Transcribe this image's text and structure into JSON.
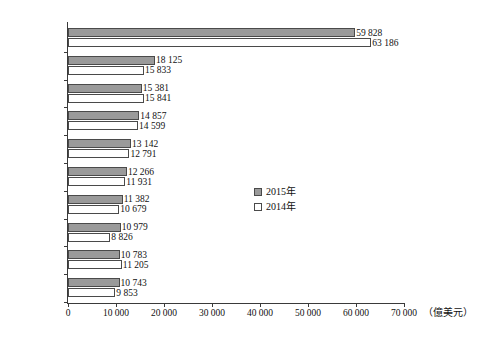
{
  "chart_data": {
    "type": "bar",
    "orientation": "horizontal",
    "title": "",
    "xlabel": "（億美元）",
    "ylabel": "",
    "xlim": [
      0,
      70000
    ],
    "xticks": [
      0,
      10000,
      20000,
      30000,
      40000,
      50000,
      60000,
      70000
    ],
    "xtick_labels": [
      "0",
      "10 000",
      "20 000",
      "30 000",
      "40 000",
      "50 000",
      "60 000",
      "70 000"
    ],
    "grid": false,
    "legend_position": "center-right",
    "categories": [
      "美國",
      "德國",
      "英國",
      "香港",
      "法國",
      "日本",
      "瑞士",
      "中國內地",
      "加拿大",
      "荷蘭"
    ],
    "series": [
      {
        "name": "2015年",
        "color": "#9a9a9a",
        "values": [
          59828,
          18125,
          15381,
          14857,
          13142,
          12266,
          11382,
          10979,
          10783,
          10743
        ],
        "value_labels": [
          "59 828",
          "18 125",
          "15 381",
          "14 857",
          "13 142",
          "12 266",
          "11 382",
          "10 979",
          "10 783",
          "10 743"
        ]
      },
      {
        "name": "2014年",
        "color": "#ffffff",
        "values": [
          63186,
          15833,
          15841,
          14599,
          12791,
          11931,
          10679,
          8826,
          11205,
          9853
        ],
        "value_labels": [
          "63 186",
          "15 833",
          "15 841",
          "14 599",
          "12 791",
          "11 931",
          "10 679",
          "8 826",
          "11 205",
          "9 853"
        ]
      }
    ]
  },
  "legend": {
    "items": [
      {
        "label": "2015年",
        "style": "filled"
      },
      {
        "label": "2014年",
        "style": "hollow"
      }
    ]
  },
  "axis": {
    "unit_label": "（億美元）"
  }
}
